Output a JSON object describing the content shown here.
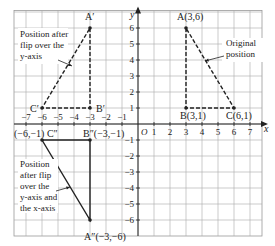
{
  "chart_data": {
    "type": "diagram",
    "title": "",
    "xlabel": "x",
    "ylabel": "y",
    "origin_label": "O",
    "x_ticks": [
      -7,
      -6,
      -5,
      -4,
      -3,
      -2,
      -1,
      1,
      2,
      3,
      4,
      5,
      6,
      7
    ],
    "y_ticks": [
      6,
      5,
      4,
      3,
      2,
      1,
      -1,
      -2,
      -3,
      -4,
      -5,
      -6
    ],
    "xlim": [
      -7.75,
      7.75
    ],
    "ylim": [
      -7,
      7.1
    ],
    "grid": true,
    "triangles": [
      {
        "name": "original",
        "style": "dashed",
        "points": [
          {
            "label": "A(3,6)",
            "x": 3,
            "y": 6
          },
          {
            "label": "B(3,1)",
            "x": 3,
            "y": 1
          },
          {
            "label": "C(6,1)",
            "x": 6,
            "y": 1
          }
        ],
        "annotation": "Original position"
      },
      {
        "name": "flip-y-axis",
        "style": "dashed",
        "points": [
          {
            "label": "A′",
            "x": -3,
            "y": 6
          },
          {
            "label": "B′",
            "x": -3,
            "y": 1
          },
          {
            "label": "C′",
            "x": -6,
            "y": 1
          }
        ],
        "annotation": "Position after flip over the y-axis"
      },
      {
        "name": "flip-both-axes",
        "style": "solid",
        "points": [
          {
            "label": "A″(−3,−6)",
            "x": -3,
            "y": -6
          },
          {
            "label": "B″(−3,−1)",
            "x": -3,
            "y": -1
          },
          {
            "label": "(−6,−1) C″",
            "x": -6,
            "y": -1
          }
        ],
        "annotation": "Position after flip over the y-axis and the x-axis"
      }
    ]
  },
  "labels": {
    "A": "A(3,6)",
    "B": "B(3,1)",
    "C": "C(6,1)",
    "A1": "A′",
    "B1": "B′",
    "C1": "C′",
    "A2": "A″(−3,−6)",
    "B2": "B″(−3,−1)",
    "C2": "(−6,−1) C″",
    "x_axis": "x",
    "y_axis": "y",
    "origin": "O"
  },
  "notes": {
    "original": [
      "Original",
      "position"
    ],
    "flip_y": [
      "Position after",
      "flip over the",
      "y-axis"
    ],
    "flip_xy": [
      "Position",
      "after flip",
      "over the",
      "y-axis and",
      "the x-axis"
    ]
  },
  "ticks": {
    "x": [
      "−7",
      "−6",
      "−5",
      "−4",
      "−3",
      "−2",
      "−1",
      "1",
      "2",
      "3",
      "4",
      "5",
      "6",
      "7"
    ],
    "y": [
      "6",
      "5",
      "4",
      "3",
      "2",
      "1",
      "−1",
      "−2",
      "−3",
      "−4",
      "−5",
      "−6"
    ]
  }
}
